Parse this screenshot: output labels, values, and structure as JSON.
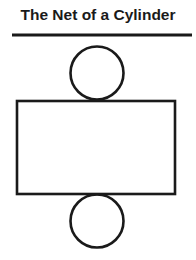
{
  "title": "The Net of a Cylinder",
  "colors": {
    "stroke": "#1a1a1a",
    "background": "#ffffff"
  },
  "diagram": {
    "rule": {
      "x1": 12,
      "y1": 35,
      "x2": 192,
      "y2": 35,
      "width": 3
    },
    "top_circle": {
      "cx": 97,
      "cy": 73,
      "r": 26.5
    },
    "rectangle": {
      "x": 17,
      "y": 101,
      "width": 158,
      "height": 93
    },
    "bottom_circle": {
      "cx": 97,
      "cy": 221,
      "r": 26.5
    }
  }
}
